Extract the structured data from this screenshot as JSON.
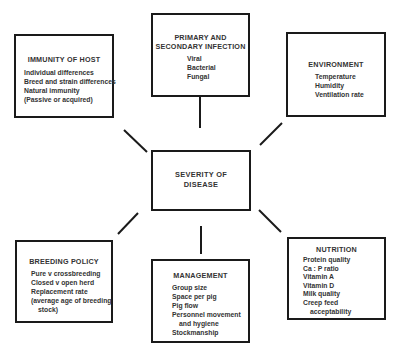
{
  "center": {
    "title_line1": "SEVERITY OF",
    "title_line2": "DISEASE"
  },
  "factors": {
    "immunity": {
      "title": "IMMUNITY OF HOST",
      "items": [
        "Individual differences",
        "Breed and strain differences",
        "Natural immunity",
        "(Passive or acquired)"
      ]
    },
    "infection": {
      "title_line1": "PRIMARY AND",
      "title_line2": "SECONDARY INFECTION",
      "items": [
        "Viral",
        "Bacterial",
        "Fungal"
      ]
    },
    "environment": {
      "title": "ENVIRONMENT",
      "items": [
        "Temperature",
        "Humidity",
        "Ventilation rate"
      ]
    },
    "breeding": {
      "title": "BREEDING POLICY",
      "items": [
        "Pure v crossbreeding",
        "Closed v open herd",
        "Replacement rate",
        "(average age of breeding",
        "stock)"
      ]
    },
    "management": {
      "title": "MANAGEMENT",
      "items": [
        "Group size",
        "Space per pig",
        "Pig flow",
        "Personnel movement",
        "and hygiene",
        "Stockmanship"
      ]
    },
    "nutrition": {
      "title": "NUTRITION",
      "items": [
        "Protein quality",
        "Ca : P ratio",
        "Vitamin A",
        "Vitamin D",
        "Milk quality",
        "Creep feed",
        "acceptability"
      ]
    }
  },
  "colors": {
    "line": "#1a1a1a",
    "text": "#333333",
    "background": "#ffffff"
  }
}
